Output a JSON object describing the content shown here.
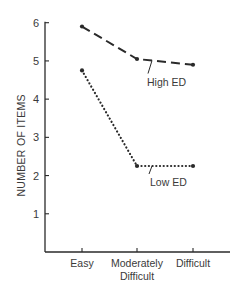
{
  "chart_data": {
    "type": "line",
    "title": "",
    "xlabel": "",
    "ylabel": "NUMBER OF ITEMS",
    "categories": [
      "Easy",
      "Moderately Difficult",
      "Difficult"
    ],
    "category_lines": [
      [
        "Easy"
      ],
      [
        "Moderately",
        "Difficult"
      ],
      [
        "Difficult"
      ]
    ],
    "yticks": [
      1,
      2,
      3,
      4,
      5,
      6
    ],
    "ylim": [
      0,
      6
    ],
    "grid": false,
    "series": [
      {
        "name": "High ED",
        "style": "dashed",
        "values": [
          5.9,
          5.05,
          4.9
        ]
      },
      {
        "name": "Low ED",
        "style": "dotted",
        "values": [
          4.75,
          2.25,
          2.25
        ]
      }
    ],
    "annotations": [
      {
        "text": "High ED",
        "series": "High ED"
      },
      {
        "text": "Low ED",
        "series": "Low ED"
      }
    ]
  },
  "colors": {
    "ink": "#2a2a2a",
    "background": "#ffffff"
  }
}
